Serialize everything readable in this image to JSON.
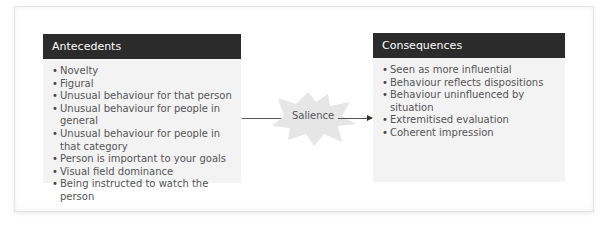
{
  "diagram": {
    "antecedents": {
      "title": "Antecedents",
      "items": [
        "Novelty",
        "Figural",
        "Unusual behaviour for that person",
        "Unusual behaviour for people in general",
        "Unusual behaviour for people in that category",
        "Person is important to your goals",
        "Visual field dominance",
        "Being instructed to watch the person"
      ]
    },
    "center": {
      "label": "Salience",
      "icon": "starburst-shape"
    },
    "consequences": {
      "title": "Consequences",
      "items": [
        "Seen as more influential",
        "Behaviour reflects dispositions",
        "Behaviour uninfluenced by situation",
        "Extremitised evaluation",
        "Coherent impression"
      ]
    },
    "colors": {
      "header_bg": "#2b2b2b",
      "box_bg": "#f3f3f3",
      "text": "#555555",
      "burst": "#e6e6e6"
    }
  }
}
